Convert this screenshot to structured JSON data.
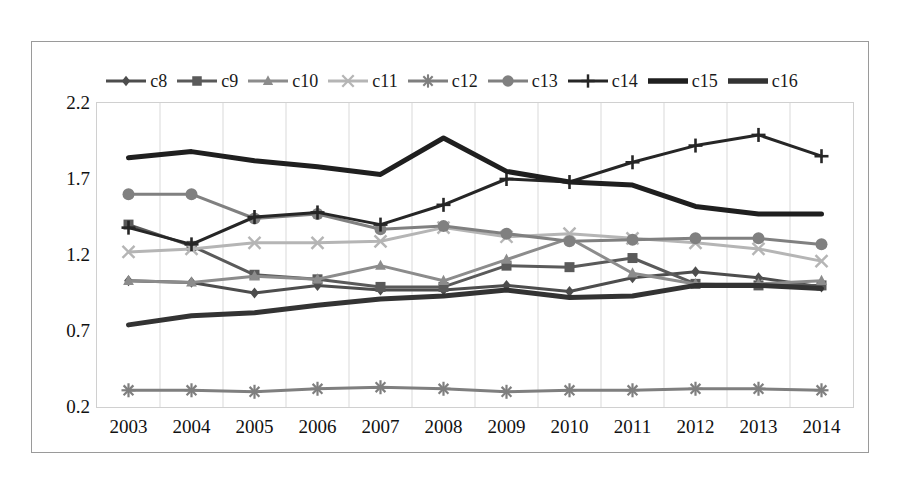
{
  "chart_data": {
    "type": "line",
    "title": "",
    "xlabel": "",
    "ylabel": "",
    "categories": [
      "2003",
      "2004",
      "2005",
      "2006",
      "2007",
      "2008",
      "2009",
      "2010",
      "2011",
      "2012",
      "2013",
      "2014"
    ],
    "x": [
      2003,
      2004,
      2005,
      2006,
      2007,
      2008,
      2009,
      2010,
      2011,
      2012,
      2013,
      2014
    ],
    "ylim": [
      0.2,
      2.2
    ],
    "yticks": [
      "0.2",
      "0.7",
      "1.2",
      "1.7",
      "2.2"
    ],
    "ytick_values": [
      0.2,
      0.7,
      1.2,
      1.7,
      2.2
    ],
    "grid": "vertical",
    "legend_position": "top",
    "series": [
      {
        "name": "c8",
        "marker": "diamond",
        "color": "#4d4d4d",
        "values": [
          1.03,
          1.02,
          0.95,
          1.0,
          0.97,
          0.97,
          1.0,
          0.96,
          1.05,
          1.09,
          1.05,
          0.99
        ]
      },
      {
        "name": "c9",
        "marker": "square",
        "color": "#5a5a5a",
        "values": [
          1.4,
          1.26,
          1.07,
          1.04,
          0.99,
          0.99,
          1.13,
          1.12,
          1.18,
          1.01,
          1.0,
          1.0
        ]
      },
      {
        "name": "c10",
        "marker": "triangle",
        "color": "#8c8c8c",
        "values": [
          1.03,
          1.02,
          1.06,
          1.04,
          1.13,
          1.03,
          1.17,
          1.31,
          1.08,
          1.01,
          1.01,
          1.03
        ]
      },
      {
        "name": "c11",
        "marker": "x",
        "color": "#b5b5b5",
        "values": [
          1.22,
          1.24,
          1.28,
          1.28,
          1.29,
          1.38,
          1.32,
          1.34,
          1.31,
          1.28,
          1.24,
          1.16
        ]
      },
      {
        "name": "c12",
        "marker": "asterisk",
        "color": "#7f7f7f",
        "values": [
          0.31,
          0.31,
          0.3,
          0.32,
          0.33,
          0.32,
          0.3,
          0.31,
          0.31,
          0.32,
          0.32,
          0.31
        ]
      },
      {
        "name": "c13",
        "marker": "circle",
        "color": "#808080",
        "values": [
          1.6,
          1.6,
          1.44,
          1.47,
          1.37,
          1.39,
          1.34,
          1.29,
          1.3,
          1.31,
          1.31,
          1.27
        ]
      },
      {
        "name": "c14",
        "marker": "plus",
        "color": "#262626",
        "values": [
          1.38,
          1.27,
          1.45,
          1.48,
          1.4,
          1.53,
          1.7,
          1.68,
          1.81,
          1.92,
          1.99,
          1.85
        ]
      },
      {
        "name": "c15",
        "marker": "line",
        "color": "#1f1f1f",
        "values": [
          1.84,
          1.88,
          1.82,
          1.78,
          1.73,
          1.97,
          1.75,
          1.68,
          1.66,
          1.52,
          1.47,
          1.47
        ]
      },
      {
        "name": "c16",
        "marker": "line",
        "color": "#333333",
        "values": [
          0.74,
          0.8,
          0.82,
          0.87,
          0.91,
          0.93,
          0.97,
          0.92,
          0.93,
          1.0,
          1.0,
          0.98
        ]
      }
    ]
  },
  "legend": {
    "items": [
      {
        "label": "c8",
        "icon": "diamond-marker-icon"
      },
      {
        "label": "c9",
        "icon": "square-marker-icon"
      },
      {
        "label": "c10",
        "icon": "triangle-marker-icon"
      },
      {
        "label": "c11",
        "icon": "x-marker-icon"
      },
      {
        "label": "c12",
        "icon": "asterisk-marker-icon"
      },
      {
        "label": "c13",
        "icon": "circle-marker-icon"
      },
      {
        "label": "c14",
        "icon": "plus-marker-icon"
      },
      {
        "label": "c15",
        "icon": "line-marker-icon"
      },
      {
        "label": "c16",
        "icon": "line-marker-icon"
      }
    ]
  }
}
